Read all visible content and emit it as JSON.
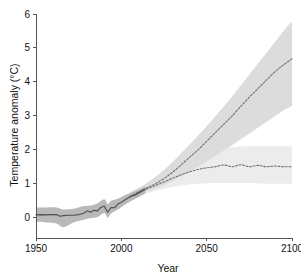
{
  "chart_data": {
    "type": "line",
    "title": "",
    "subtitle": "",
    "xlabel": "Year",
    "ylabel": "Temperature anomaly (°C)",
    "xlim": [
      1950,
      2100
    ],
    "ylim": [
      -0.6,
      6
    ],
    "xticks": [
      1950,
      2000,
      2050,
      2100
    ],
    "xtick_labels": [
      "1950",
      "2000",
      "2050",
      "2100"
    ],
    "yticks": [
      0,
      1,
      2,
      3,
      4,
      5,
      6
    ],
    "ytick_labels": [
      "0",
      "1",
      "2",
      "3",
      "4",
      "5",
      "6"
    ],
    "grid": false,
    "legend": "none",
    "colors": {
      "historical_line": "#4d4d4d",
      "historical_band": "#b9b9b9",
      "projection_line": "#6e6e6e",
      "high_band": "#dcdcdc",
      "low_band": "#ececec",
      "axis": "#555555",
      "text": "#111111",
      "background": "#ffffff"
    },
    "series": [
      {
        "name": "Historical observations",
        "style": "solid",
        "color": "#4d4d4d",
        "x": [
          1950,
          1953,
          1956,
          1959,
          1962,
          1964,
          1966,
          1969,
          1972,
          1975,
          1978,
          1980,
          1982,
          1984,
          1986,
          1988,
          1990,
          1991,
          1992,
          1993,
          1994,
          1996,
          1998,
          2000,
          2002,
          2004,
          2006,
          2008,
          2010,
          2012,
          2014
        ],
        "values": [
          0.08,
          0.09,
          0.08,
          0.09,
          0.09,
          0.04,
          0.06,
          0.07,
          0.07,
          0.09,
          0.13,
          0.2,
          0.16,
          0.22,
          0.2,
          0.3,
          0.34,
          0.24,
          0.16,
          0.23,
          0.3,
          0.29,
          0.4,
          0.45,
          0.52,
          0.58,
          0.63,
          0.66,
          0.72,
          0.78,
          0.83
        ]
      },
      {
        "name": "Historical uncertainty band lower",
        "style": "band-lower",
        "x": [
          1950,
          1956,
          1962,
          1966,
          1972,
          1978,
          1982,
          1986,
          1990,
          1992,
          1994,
          1998,
          2002,
          2006,
          2010,
          2014
        ],
        "values": [
          -0.12,
          -0.14,
          -0.17,
          -0.28,
          -0.14,
          -0.06,
          -0.02,
          0.02,
          0.14,
          0.0,
          0.12,
          0.24,
          0.38,
          0.5,
          0.6,
          0.72
        ]
      },
      {
        "name": "Historical uncertainty band upper",
        "style": "band-upper",
        "x": [
          1950,
          1956,
          1962,
          1966,
          1972,
          1978,
          1982,
          1986,
          1990,
          1992,
          1994,
          1998,
          2002,
          2006,
          2010,
          2014
        ],
        "values": [
          0.3,
          0.3,
          0.3,
          0.24,
          0.26,
          0.34,
          0.36,
          0.42,
          0.54,
          0.4,
          0.5,
          0.56,
          0.66,
          0.74,
          0.82,
          0.92
        ]
      },
      {
        "name": "High emissions projection",
        "style": "dashed",
        "color": "#6e6e6e",
        "x": [
          2005,
          2010,
          2015,
          2020,
          2025,
          2030,
          2035,
          2040,
          2045,
          2050,
          2055,
          2060,
          2065,
          2070,
          2075,
          2080,
          2085,
          2090,
          2095,
          2100
        ],
        "values": [
          0.62,
          0.76,
          0.88,
          1.0,
          1.15,
          1.34,
          1.55,
          1.78,
          2.0,
          2.25,
          2.5,
          2.75,
          3.0,
          3.28,
          3.55,
          3.8,
          4.05,
          4.3,
          4.5,
          4.68
        ]
      },
      {
        "name": "High emissions band lower",
        "style": "band-lower",
        "x": [
          2005,
          2015,
          2025,
          2035,
          2045,
          2055,
          2065,
          2075,
          2085,
          2095,
          2100
        ],
        "values": [
          0.52,
          0.76,
          0.95,
          1.22,
          1.5,
          1.82,
          2.14,
          2.48,
          2.82,
          3.16,
          3.3
        ]
      },
      {
        "name": "High emissions band upper",
        "style": "band-upper",
        "x": [
          2005,
          2015,
          2025,
          2035,
          2045,
          2055,
          2065,
          2075,
          2085,
          2095,
          2100
        ],
        "values": [
          0.74,
          1.02,
          1.4,
          1.9,
          2.42,
          2.98,
          3.58,
          4.22,
          4.85,
          5.5,
          5.78
        ]
      },
      {
        "name": "Low emissions projection",
        "style": "dashed",
        "color": "#6e6e6e",
        "x": [
          2005,
          2010,
          2015,
          2020,
          2025,
          2030,
          2035,
          2040,
          2045,
          2050,
          2055,
          2060,
          2065,
          2070,
          2075,
          2080,
          2085,
          2090,
          2095,
          2100
        ],
        "values": [
          0.62,
          0.74,
          0.85,
          0.95,
          1.05,
          1.16,
          1.26,
          1.35,
          1.42,
          1.47,
          1.5,
          1.55,
          1.5,
          1.56,
          1.5,
          1.54,
          1.5,
          1.52,
          1.5,
          1.5
        ]
      },
      {
        "name": "Low emissions band lower",
        "style": "band-lower",
        "x": [
          2005,
          2015,
          2025,
          2035,
          2045,
          2055,
          2065,
          2075,
          2085,
          2095,
          2100
        ],
        "values": [
          0.52,
          0.72,
          0.85,
          0.95,
          1.0,
          1.02,
          1.02,
          1.02,
          1.0,
          1.0,
          1.0
        ]
      },
      {
        "name": "Low emissions band upper",
        "style": "band-upper",
        "x": [
          2005,
          2015,
          2025,
          2035,
          2045,
          2055,
          2065,
          2075,
          2085,
          2095,
          2100
        ],
        "values": [
          0.74,
          1.0,
          1.3,
          1.6,
          1.85,
          2.0,
          2.08,
          2.1,
          2.1,
          2.1,
          2.1
        ]
      }
    ]
  }
}
